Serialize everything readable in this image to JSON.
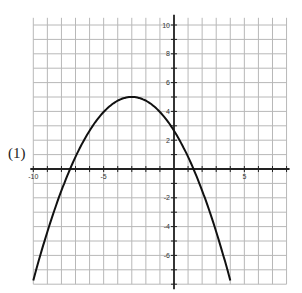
{
  "problem_label": "(1)",
  "chart_data": {
    "type": "line",
    "title": "",
    "xlabel": "",
    "ylabel": "",
    "xlim": [
      -10,
      8
    ],
    "ylim": [
      -8,
      10.5
    ],
    "grid": true,
    "x_tick_labels": [
      {
        "value": -10,
        "label": "-10"
      },
      {
        "value": -5,
        "label": "-5"
      },
      {
        "value": 5,
        "label": "5"
      }
    ],
    "y_tick_labels": [
      {
        "value": 10,
        "label": "10"
      },
      {
        "value": 8,
        "label": "8"
      },
      {
        "value": 6,
        "label": "6"
      },
      {
        "value": 4,
        "label": "4"
      },
      {
        "value": 2,
        "label": "2"
      },
      {
        "value": -2,
        "label": "-2"
      },
      {
        "value": -4,
        "label": "-4"
      },
      {
        "value": -6,
        "label": "-6"
      }
    ],
    "series": [
      {
        "name": "parabola",
        "equation": "y = -0.26(x+3)^2 + 5",
        "vertex": [
          -3,
          5
        ],
        "y_intercept": 2.7,
        "roots": [
          -7.4,
          1.4
        ],
        "x_range": [
          -10,
          4
        ],
        "x": [
          -10,
          -9,
          -8,
          -7,
          -6,
          -5,
          -4,
          -3,
          -2,
          -1,
          0,
          1,
          2,
          3,
          4
        ],
        "y": [
          -7.74,
          -4.36,
          -1.5,
          0.84,
          2.66,
          3.96,
          4.74,
          5,
          4.74,
          3.96,
          2.66,
          0.84,
          -1.5,
          -4.36,
          -7.74
        ]
      }
    ],
    "colors": {
      "curve": "#111111",
      "axes": "#222222",
      "grid": "#b8b8b8"
    }
  }
}
